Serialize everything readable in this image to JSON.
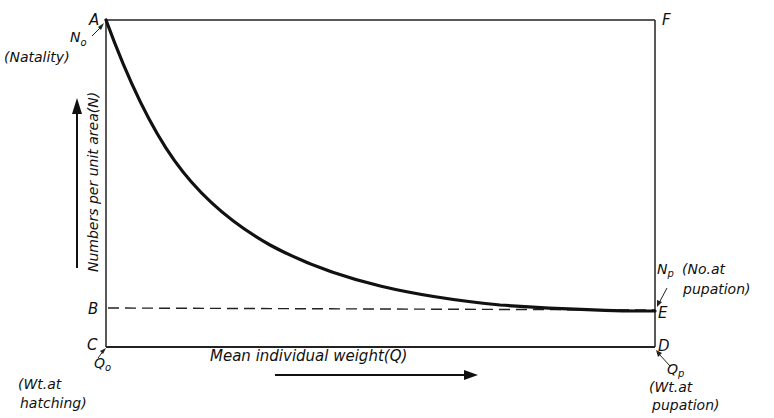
{
  "diagram": {
    "type": "population-curve",
    "points": {
      "A": "A",
      "B": "B",
      "C": "C",
      "D": "D",
      "E": "E",
      "F": "F"
    },
    "annotations": {
      "natality_symbol": "N",
      "natality_sub": "o",
      "natality_label": "(Natality)",
      "pupation_number_symbol": "N",
      "pupation_number_sub": "p",
      "pupation_number_label_1": "(No.at",
      "pupation_number_label_2": "pupation)",
      "hatching_weight_symbol": "Q",
      "hatching_weight_sub": "o",
      "hatching_weight_label_1": "(Wt.at",
      "hatching_weight_label_2": "hatching)",
      "pupation_weight_symbol": "Q",
      "pupation_weight_sub": "p",
      "pupation_weight_label_1": "(Wt.at",
      "pupation_weight_label_2": "pupation)"
    },
    "axes": {
      "y_label": "Numbers per unit area(N)",
      "x_label": "Mean individual weight(Q)"
    },
    "curve": {
      "description": "Decreasing curve from A (N0 at Q0) to E (Np at Qp), asymptotically approaching dashed line B-E",
      "start": "A",
      "end": "E"
    },
    "colors": {
      "ink": "#111111",
      "background": "#ffffff"
    }
  }
}
